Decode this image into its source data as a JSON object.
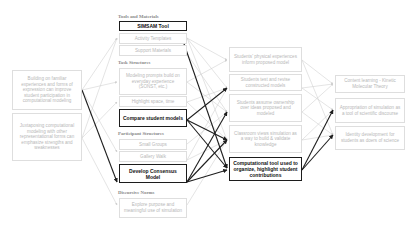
{
  "left_column": [
    {
      "id": "L1",
      "text": "Building on familiar experiences and forms of expression can improve student participation in computational modeling"
    },
    {
      "id": "L2",
      "text": "Juxtaposing computational modeling with other representational forms can emphasize strengths and weaknesses"
    }
  ],
  "middle_column": {
    "sections": [
      {
        "label": "Tools and Materials",
        "items": [
          {
            "id": "M1",
            "text": "SIMSAM Tool",
            "emphasis": true
          },
          {
            "id": "M2",
            "text": "Activity Templates",
            "emphasis": false
          },
          {
            "id": "M3",
            "text": "Support Materials",
            "emphasis": false
          }
        ]
      },
      {
        "label": "Task Structures",
        "items": [
          {
            "id": "M4",
            "text": "Modeling prompts build on everyday experience (SONST, etc.)",
            "emphasis": false
          },
          {
            "id": "M5",
            "text": "Highlight space, time",
            "emphasis": false
          },
          {
            "id": "M6",
            "text": "Compare student models",
            "emphasis": true
          }
        ]
      },
      {
        "label": "Participant Structures",
        "items": [
          {
            "id": "M7",
            "text": "Small Groups",
            "emphasis": false
          },
          {
            "id": "M8",
            "text": "Gallery Walk",
            "emphasis": false
          },
          {
            "id": "M9",
            "text": "Develop Consensus Model",
            "emphasis": true
          }
        ]
      },
      {
        "label": "Discursive Norms",
        "items": [
          {
            "id": "M10",
            "text": "Explore purpose and meaningful use of simulation",
            "emphasis": false
          }
        ]
      }
    ]
  },
  "mediating_column": [
    {
      "id": "C1",
      "text": "Students' physical experiences inform proposed model",
      "emphasis": false
    },
    {
      "id": "C2",
      "text": "Students test and revise constructed models",
      "emphasis": false
    },
    {
      "id": "C3",
      "text": "Students assume ownership over ideas proposed and modeled",
      "emphasis": false
    },
    {
      "id": "C4",
      "text": "Classroom views simulation as a way to build & validate knowledge",
      "emphasis": false
    },
    {
      "id": "C5",
      "text": "Computational tool used to organize, highlight student contributions",
      "emphasis": true
    }
  ],
  "outcome_column": [
    {
      "id": "O1",
      "text": "Content learning - Kinetic Molecular Theory"
    },
    {
      "id": "O2",
      "text": "Appropriation of simulation as a tool of scientific discourse"
    },
    {
      "id": "O3",
      "text": "Identity development for students as doers of science"
    }
  ],
  "colors": {
    "thin_arrow": "#d2d2d2",
    "thick_arrow": "#1e1e1e",
    "muted_text": "#b8b8b8",
    "bold_text": "#111111"
  }
}
